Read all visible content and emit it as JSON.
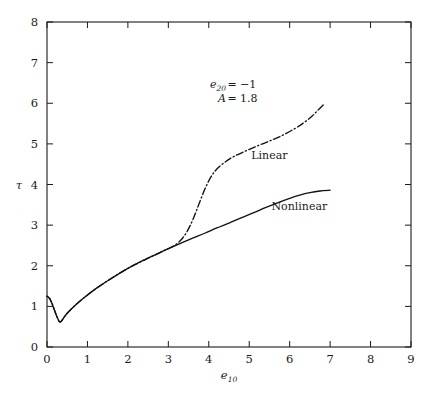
{
  "chart_data": {
    "type": "line",
    "title": "",
    "xlabel": "e10",
    "ylabel": "tau",
    "xlabel_base": "e",
    "xlabel_sub": "10",
    "ylabel_glyph": "τ",
    "xlim": [
      0,
      9
    ],
    "ylim": [
      0,
      8
    ],
    "xticks": [
      "0",
      "1",
      "2",
      "3",
      "4",
      "5",
      "6",
      "7",
      "8",
      "9"
    ],
    "yticks": [
      "0",
      "1",
      "2",
      "3",
      "4",
      "5",
      "6",
      "7",
      "8"
    ],
    "grid": false,
    "legend": "inline-labels",
    "annotations": [
      {
        "name": "param-e20",
        "base": "e",
        "sub": "20",
        "eq": "=",
        "value": "−1"
      },
      {
        "name": "param-A",
        "base": "A",
        "sub": "",
        "eq": "=",
        "value": "1.8"
      }
    ],
    "series": [
      {
        "name": "Linear",
        "label": "Linear",
        "style": "dash-dot",
        "color": "#111111",
        "points": [
          [
            0.0,
            1.25
          ],
          [
            0.06,
            1.2
          ],
          [
            0.12,
            1.08
          ],
          [
            0.18,
            0.92
          ],
          [
            0.24,
            0.76
          ],
          [
            0.3,
            0.63
          ],
          [
            0.34,
            0.62
          ],
          [
            0.4,
            0.7
          ],
          [
            0.5,
            0.83
          ],
          [
            0.7,
            1.03
          ],
          [
            0.9,
            1.2
          ],
          [
            1.2,
            1.43
          ],
          [
            1.5,
            1.63
          ],
          [
            1.8,
            1.82
          ],
          [
            2.1,
            1.99
          ],
          [
            2.4,
            2.14
          ],
          [
            2.7,
            2.28
          ],
          [
            3.0,
            2.42
          ],
          [
            3.15,
            2.5
          ],
          [
            3.3,
            2.62
          ],
          [
            3.45,
            2.82
          ],
          [
            3.6,
            3.12
          ],
          [
            3.75,
            3.5
          ],
          [
            3.9,
            3.88
          ],
          [
            4.05,
            4.18
          ],
          [
            4.2,
            4.38
          ],
          [
            4.4,
            4.55
          ],
          [
            4.6,
            4.68
          ],
          [
            4.9,
            4.82
          ],
          [
            5.2,
            4.95
          ],
          [
            5.5,
            5.07
          ],
          [
            5.8,
            5.2
          ],
          [
            6.1,
            5.36
          ],
          [
            6.35,
            5.52
          ],
          [
            6.55,
            5.68
          ],
          [
            6.7,
            5.83
          ],
          [
            6.85,
            5.98
          ]
        ]
      },
      {
        "name": "Nonlinear",
        "label": "Nonlinear",
        "style": "solid",
        "color": "#111111",
        "points": [
          [
            0.0,
            1.25
          ],
          [
            0.06,
            1.2
          ],
          [
            0.12,
            1.08
          ],
          [
            0.18,
            0.92
          ],
          [
            0.24,
            0.76
          ],
          [
            0.3,
            0.63
          ],
          [
            0.34,
            0.62
          ],
          [
            0.4,
            0.7
          ],
          [
            0.5,
            0.83
          ],
          [
            0.7,
            1.03
          ],
          [
            0.9,
            1.2
          ],
          [
            1.2,
            1.43
          ],
          [
            1.5,
            1.63
          ],
          [
            1.8,
            1.82
          ],
          [
            2.1,
            1.99
          ],
          [
            2.4,
            2.14
          ],
          [
            2.7,
            2.28
          ],
          [
            3.0,
            2.42
          ],
          [
            3.3,
            2.55
          ],
          [
            3.6,
            2.68
          ],
          [
            3.9,
            2.8
          ],
          [
            4.2,
            2.93
          ],
          [
            4.5,
            3.05
          ],
          [
            4.8,
            3.18
          ],
          [
            5.1,
            3.3
          ],
          [
            5.4,
            3.43
          ],
          [
            5.7,
            3.55
          ],
          [
            6.0,
            3.66
          ],
          [
            6.25,
            3.74
          ],
          [
            6.5,
            3.8
          ],
          [
            6.75,
            3.84
          ],
          [
            7.0,
            3.86
          ]
        ]
      }
    ],
    "series_labels": [
      {
        "name": "label-linear",
        "text": "Linear",
        "x": 5.05,
        "y": 4.62
      },
      {
        "name": "label-nonlinear",
        "text": "Nonlinear",
        "x": 5.55,
        "y": 3.38
      }
    ]
  }
}
